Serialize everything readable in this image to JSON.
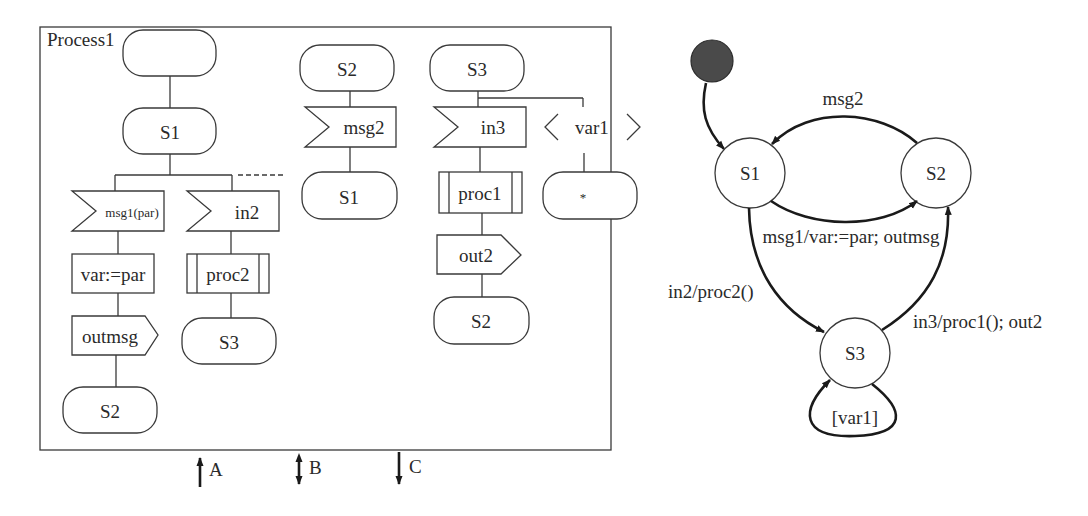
{
  "sdl": {
    "process_name": "Process1",
    "columns": [
      {
        "start": "",
        "state": "S1",
        "branches": [
          {
            "input": "msg1(par)",
            "task": "var:=par",
            "output": "outmsg",
            "next_state": "S2"
          },
          {
            "input": "in2",
            "procedure": "proc2",
            "next_state": "S3"
          }
        ]
      },
      {
        "state": "S2",
        "input": "msg2",
        "next_state": "S1"
      },
      {
        "state": "S3",
        "branches": [
          {
            "input": "in3",
            "procedure": "proc1",
            "output": "out2",
            "next_state": "S2"
          },
          {
            "continuous_signal": "var1",
            "next_state": "*"
          }
        ]
      }
    ],
    "signals": [
      {
        "label": "A",
        "direction": "in"
      },
      {
        "label": "B",
        "direction": "bidirectional"
      },
      {
        "label": "C",
        "direction": "out"
      }
    ]
  },
  "state_machine": {
    "states": [
      "S1",
      "S2",
      "S3"
    ],
    "transitions": [
      {
        "from": "initial",
        "to": "S1",
        "label": ""
      },
      {
        "from": "S2",
        "to": "S1",
        "label": "msg2"
      },
      {
        "from": "S1",
        "to": "S2",
        "label": "msg1/var:=par; outmsg"
      },
      {
        "from": "S1",
        "to": "S3",
        "label": "in2/proc2()"
      },
      {
        "from": "S3",
        "to": "S2",
        "label": "in3/proc1(); out2"
      },
      {
        "from": "S3",
        "to": "S3",
        "label": "[var1]"
      }
    ]
  }
}
